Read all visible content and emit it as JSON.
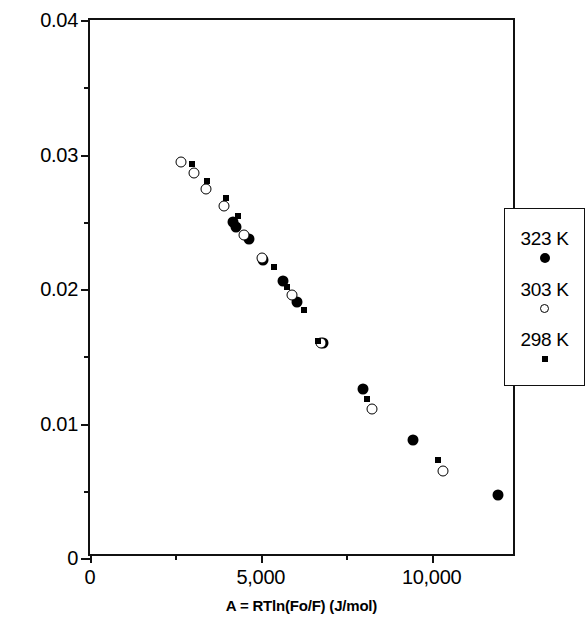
{
  "chart_data": {
    "type": "scatter",
    "title": "",
    "xlabel": "A = RTln(Fo/F) (J/mol)",
    "ylabel": "Volume Adsorbed (cc/g, raw coal basis)",
    "xlim": [
      0,
      12500
    ],
    "ylim": [
      0,
      0.04
    ],
    "xticks": [
      0,
      2500,
      5000,
      7500,
      10000
    ],
    "xtick_labels": [
      "0",
      "",
      "5,000",
      "",
      "10,000"
    ],
    "xtick_major": [
      0,
      5000,
      10000
    ],
    "yticks": [
      0,
      0.005,
      0.01,
      0.015,
      0.02,
      0.025,
      0.03,
      0.035,
      0.04
    ],
    "ytick_labels": [
      "0",
      "",
      "0.01",
      "",
      "0.02",
      "",
      "0.03",
      "",
      "0.04"
    ],
    "ytick_major": [
      0,
      0.01,
      0.02,
      0.03,
      0.04
    ],
    "grid": false,
    "legend_position": "right-inside",
    "series": [
      {
        "name": "323 K",
        "marker": "filled-circle",
        "color": "#000000",
        "points": [
          [
            4180,
            0.02495
          ],
          [
            4280,
            0.0246
          ],
          [
            4640,
            0.0237
          ],
          [
            5070,
            0.02215
          ],
          [
            5660,
            0.0206
          ],
          [
            6070,
            0.01905
          ],
          [
            6820,
            0.016
          ],
          [
            7990,
            0.01255
          ],
          [
            9470,
            0.0088
          ],
          [
            11950,
            0.00465
          ]
        ]
      },
      {
        "name": "303 K",
        "marker": "open-circle",
        "color": "#000000",
        "points": [
          [
            2660,
            0.02945
          ],
          [
            3030,
            0.0286
          ],
          [
            3410,
            0.02745
          ],
          [
            3930,
            0.0262
          ],
          [
            4500,
            0.02405
          ],
          [
            5030,
            0.0223
          ],
          [
            5900,
            0.01955
          ],
          [
            6760,
            0.01595
          ],
          [
            8250,
            0.01105
          ],
          [
            10330,
            0.0065
          ]
        ]
      },
      {
        "name": "298 K",
        "marker": "small-square",
        "color": "#000000",
        "points": [
          [
            2990,
            0.0293
          ],
          [
            3420,
            0.02805
          ],
          [
            3990,
            0.02675
          ],
          [
            4330,
            0.0254
          ],
          [
            5400,
            0.0216
          ],
          [
            5780,
            0.02015
          ],
          [
            6250,
            0.01845
          ],
          [
            6680,
            0.01615
          ],
          [
            8100,
            0.01185
          ],
          [
            10180,
            0.0073
          ]
        ]
      }
    ]
  },
  "legend": {
    "entries": [
      {
        "label": "323 K",
        "marker": "filled-circle"
      },
      {
        "label": "303 K",
        "marker": "open-circle"
      },
      {
        "label": "298 K",
        "marker": "small-square"
      }
    ]
  }
}
